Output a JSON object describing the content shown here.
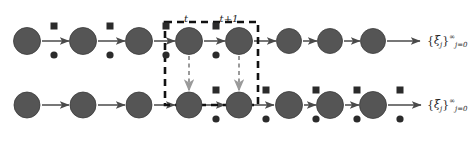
{
  "figure": {
    "type": "diagram",
    "kind": "two-row-markov-chain-lattice",
    "width": 472,
    "height": 146,
    "background": "#ffffff"
  },
  "colors": {
    "node_fill": "#555555",
    "node_stroke": "#3a3a3a",
    "marker_fill": "#2b2b2b",
    "arrow": "#4a4a4a",
    "dashed_box": "#111111",
    "vertical_dashed_arrow": "#9a9a9a",
    "text": "#1d1d1d"
  },
  "time_labels": [
    {
      "text": "t",
      "x": 186,
      "y": 14
    },
    {
      "text": "t+1",
      "x": 229,
      "y": 14
    }
  ],
  "dashed_box": {
    "x": 165,
    "y": 22,
    "width": 93,
    "height": 83,
    "stroke_width": 2.6,
    "dash": "7,5"
  },
  "rows": [
    {
      "name": "top-row",
      "label": "xi-sequence-top",
      "cy": 41,
      "nodes": [
        {
          "cx": 27,
          "r": 13.5,
          "square": true,
          "dot": true
        },
        {
          "cx": 83,
          "r": 13.5,
          "square": true,
          "dot": true
        },
        {
          "cx": 139,
          "r": 13.5,
          "square": true,
          "dot": true
        },
        {
          "cx": 189,
          "r": 13.5,
          "square": true,
          "dot": true
        },
        {
          "cx": 239,
          "r": 13.5,
          "square": false,
          "dot": false
        },
        {
          "cx": 289,
          "r": 12.5,
          "square": false,
          "dot": false
        },
        {
          "cx": 330,
          "r": 12.5,
          "square": false,
          "dot": false
        },
        {
          "cx": 373,
          "r": 12.5,
          "square": false,
          "dot": false
        }
      ],
      "arrows": [
        {
          "x1": 42,
          "x2": 69
        },
        {
          "x1": 98,
          "x2": 125
        },
        {
          "x1": 154,
          "x2": 175
        },
        {
          "x1": 204,
          "x2": 225
        },
        {
          "x1": 254,
          "x2": 276
        },
        {
          "x1": 303,
          "x2": 317
        },
        {
          "x1": 344,
          "x2": 360
        },
        {
          "x1": 387,
          "x2": 420
        }
      ],
      "sequence_label": {
        "x": 427,
        "y": 34
      }
    },
    {
      "name": "bottom-row",
      "label": "xi-sequence-bottom",
      "cy": 105,
      "nodes": [
        {
          "cx": 27,
          "r": 13.0,
          "square": false,
          "dot": false
        },
        {
          "cx": 83,
          "r": 13.0,
          "square": false,
          "dot": false
        },
        {
          "cx": 139,
          "r": 13.0,
          "square": false,
          "dot": false
        },
        {
          "cx": 189,
          "r": 13.0,
          "square": true,
          "dot": true
        },
        {
          "cx": 239,
          "r": 13.0,
          "square": true,
          "dot": true
        },
        {
          "cx": 289,
          "r": 13.5,
          "square": true,
          "dot": true
        },
        {
          "cx": 330,
          "r": 13.5,
          "square": true,
          "dot": true
        },
        {
          "cx": 373,
          "r": 13.5,
          "square": true,
          "dot": true
        }
      ],
      "arrows": [
        {
          "x1": 42,
          "x2": 69
        },
        {
          "x1": 98,
          "x2": 125
        },
        {
          "x1": 154,
          "x2": 175
        },
        {
          "x1": 204,
          "x2": 225
        },
        {
          "x1": 254,
          "x2": 274
        },
        {
          "x1": 304,
          "x2": 316
        },
        {
          "x1": 345,
          "x2": 359
        },
        {
          "x1": 388,
          "x2": 421
        }
      ],
      "sequence_label": {
        "x": 427,
        "y": 98
      }
    }
  ],
  "vertical_arrows": [
    {
      "x": 189,
      "y1": 56,
      "y2": 90
    },
    {
      "x": 239,
      "y1": 56,
      "y2": 90
    }
  ],
  "sequence_label_text": {
    "open": "{",
    "symbol": "ξ",
    "subscript": "j",
    "close": "}",
    "superscript": "∞",
    "lower": "j=0",
    "plain": "{ξ_j}^∞_{j=0}"
  },
  "markers": {
    "square_size": 7,
    "square_dy": -15,
    "square_dx": 27,
    "dot_r": 3.6,
    "dot_dy": 14,
    "dot_dx": 27
  }
}
